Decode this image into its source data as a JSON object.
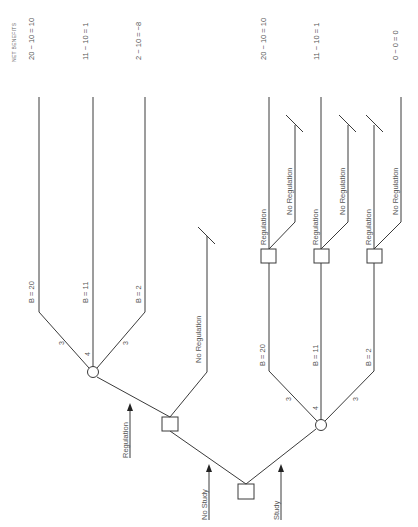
{
  "header": {
    "net_benefits_label": "NET BENEFITS"
  },
  "outcomes": [
    {
      "text": "20 − 10 = 10"
    },
    {
      "text": "11 − 10 = 1"
    },
    {
      "text": "2 − 10 = −8"
    },
    {
      "text": "20 − 10 = 10"
    },
    {
      "text": "11 − 10 = 1"
    },
    {
      "text": "0 − 0 = 0"
    }
  ],
  "no_study_branch": {
    "arrow_label": "No Study",
    "regulation_arrow_label": "Regulation",
    "no_regulation_label": "No Regulation",
    "chance_outcomes": [
      {
        "benefit": "B = 20",
        "prob": "3"
      },
      {
        "benefit": "B = 11",
        "prob": "4"
      },
      {
        "benefit": "B = 2",
        "prob": "3"
      }
    ]
  },
  "study_branch": {
    "arrow_label": "Study",
    "chance_outcomes": [
      {
        "benefit": "B = 20",
        "prob": "3",
        "reg": "Regulation",
        "noreg": "No Regulation"
      },
      {
        "benefit": "B = 11",
        "prob": "4",
        "reg": "Regulation",
        "noreg": "No Regulation"
      },
      {
        "benefit": "B = 2",
        "prob": "3",
        "reg": "Regulation",
        "noreg": "No Regulation"
      }
    ]
  },
  "colors": {
    "line": "#3a3a3a",
    "text": "#555555",
    "background": "#ffffff"
  }
}
